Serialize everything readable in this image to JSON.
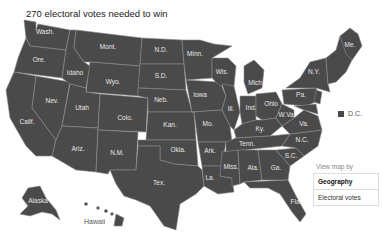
{
  "header": {
    "title": "270 electoral votes needed to win"
  },
  "map": {
    "fill_color": "#4a4a4a",
    "border_color": "#8a8a8a",
    "states": [
      {
        "abbr": "Wash.",
        "x": 45,
        "y": 34
      },
      {
        "abbr": "Ore.",
        "x": 39,
        "y": 62
      },
      {
        "abbr": "Calif.",
        "x": 27,
        "y": 124
      },
      {
        "abbr": "Nev.",
        "x": 52,
        "y": 103
      },
      {
        "abbr": "Idaho",
        "x": 75,
        "y": 75
      },
      {
        "abbr": "Mont.",
        "x": 108,
        "y": 49
      },
      {
        "abbr": "Wyo.",
        "x": 113,
        "y": 84
      },
      {
        "abbr": "Utah",
        "x": 82,
        "y": 110
      },
      {
        "abbr": "Ariz.",
        "x": 78,
        "y": 151
      },
      {
        "abbr": "Colo.",
        "x": 125,
        "y": 120
      },
      {
        "abbr": "N.M.",
        "x": 117,
        "y": 155
      },
      {
        "abbr": "N.D.",
        "x": 161,
        "y": 52
      },
      {
        "abbr": "S.D.",
        "x": 161,
        "y": 78
      },
      {
        "abbr": "Neb.",
        "x": 161,
        "y": 102
      },
      {
        "abbr": "Kan.",
        "x": 170,
        "y": 127
      },
      {
        "abbr": "Okla.",
        "x": 178,
        "y": 152
      },
      {
        "abbr": "Tex.",
        "x": 159,
        "y": 185
      },
      {
        "abbr": "Minn.",
        "x": 195,
        "y": 56
      },
      {
        "abbr": "Iowa",
        "x": 200,
        "y": 97
      },
      {
        "abbr": "Mo.",
        "x": 208,
        "y": 126
      },
      {
        "abbr": "Ark.",
        "x": 210,
        "y": 153
      },
      {
        "abbr": "La.",
        "x": 210,
        "y": 180
      },
      {
        "abbr": "Wis.",
        "x": 222,
        "y": 74
      },
      {
        "abbr": "Ill.",
        "x": 231,
        "y": 111
      },
      {
        "abbr": "Mich.",
        "x": 256,
        "y": 85
      },
      {
        "abbr": "Ind.",
        "x": 251,
        "y": 110
      },
      {
        "abbr": "Ohio",
        "x": 271,
        "y": 106
      },
      {
        "abbr": "Ky.",
        "x": 260,
        "y": 131
      },
      {
        "abbr": "Tenn.",
        "x": 247,
        "y": 146
      },
      {
        "abbr": "Miss.",
        "x": 231,
        "y": 169
      },
      {
        "abbr": "Ala.",
        "x": 253,
        "y": 170
      },
      {
        "abbr": "Ga.",
        "x": 276,
        "y": 170
      },
      {
        "abbr": "Fla.",
        "x": 296,
        "y": 204
      },
      {
        "abbr": "S.C.",
        "x": 291,
        "y": 158
      },
      {
        "abbr": "N.C.",
        "x": 302,
        "y": 142
      },
      {
        "abbr": "Va.",
        "x": 304,
        "y": 126
      },
      {
        "abbr": "W.Va.",
        "x": 287,
        "y": 117
      },
      {
        "abbr": "Pa.",
        "x": 301,
        "y": 97
      },
      {
        "abbr": "N.Y.",
        "x": 314,
        "y": 74
      },
      {
        "abbr": "Me.",
        "x": 350,
        "y": 47
      },
      {
        "abbr": "Alaska",
        "x": 38,
        "y": 203
      },
      {
        "abbr": "Hawaii",
        "x": 92,
        "y": 222
      }
    ]
  },
  "legend": {
    "dc_label": "D.C."
  },
  "view_map_by": {
    "label": "View map by",
    "options": [
      {
        "label": "Geography",
        "active": true
      },
      {
        "label": "Electoral votes",
        "active": false
      }
    ]
  }
}
